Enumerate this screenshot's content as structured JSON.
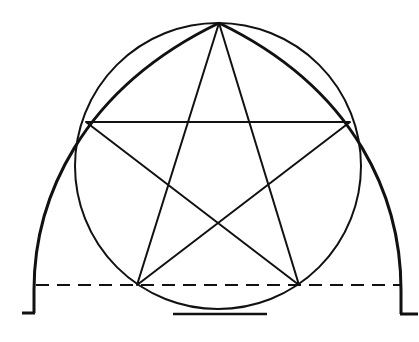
{
  "figure": {
    "colors": {
      "background": "#ffffff",
      "ink": "#111111"
    },
    "circle": {
      "cx": 218,
      "cy": 166,
      "r": 143
    },
    "pentagram": {
      "points": [
        {
          "name": "apex",
          "x": 219,
          "y": 23
        },
        {
          "name": "left",
          "x": 86,
          "y": 122
        },
        {
          "name": "right",
          "x": 350,
          "y": 122
        },
        {
          "name": "bottom-left",
          "x": 137,
          "y": 285
        },
        {
          "name": "bottom-right",
          "x": 299,
          "y": 285
        }
      ]
    },
    "arch": {
      "left_base": {
        "x": 34,
        "y": 313
      },
      "right_base": {
        "x": 401,
        "y": 314
      },
      "apex": {
        "x": 219,
        "y": 23
      }
    },
    "dashed_line": {
      "y": 285,
      "x1": 34,
      "x2": 401
    },
    "base_line": {
      "y": 314,
      "x1": 173,
      "x2": 267
    }
  }
}
